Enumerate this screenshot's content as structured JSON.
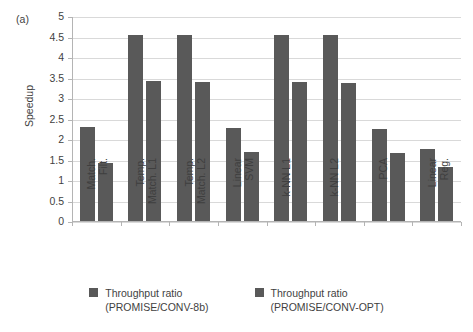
{
  "panel": {
    "label": "(a)"
  },
  "chart_data": {
    "type": "bar",
    "title": "",
    "subtitle": "",
    "xlabel": "",
    "ylabel": "Speedup",
    "ylim": [
      0,
      5
    ],
    "ytick_step": 0.5,
    "yticks": [
      "5",
      "4.5",
      "4",
      "3.5",
      "3",
      "2.5",
      "2",
      "1.5",
      "1",
      "0.5",
      "0"
    ],
    "grid": true,
    "legend_position": "bottom",
    "bar_color": "#595959",
    "categories": [
      "Match. Filt.",
      "Temp. Match. L1",
      "Temp. Match. L2",
      "Linear SVM",
      "k-NN L1",
      "k-NN L2",
      "PCA",
      "Linear Reg."
    ],
    "category_lines": [
      [
        "Match.",
        "Filt."
      ],
      [
        "Temp.",
        "Match. L1"
      ],
      [
        "Temp.",
        "Match. L2"
      ],
      [
        "Linear",
        "SVM"
      ],
      [
        "k-NN L1",
        ""
      ],
      [
        "k-NN L2",
        ""
      ],
      [
        "PCA",
        ""
      ],
      [
        "Linear",
        "Reg."
      ]
    ],
    "series": [
      {
        "name": "Throughput ratio (PROMISE/CONV-8b)",
        "name_line1": "Throughput ratio",
        "name_line2": "(PROMISE/CONV-8b)",
        "color": "#595959",
        "values": [
          2.31,
          4.57,
          4.57,
          2.3,
          4.56,
          4.55,
          2.28,
          1.79
        ]
      },
      {
        "name": "Throughput ratio (PROMISE/CONV-OPT)",
        "name_line1": "Throughput ratio",
        "name_line2": "(PROMISE/CONV-OPT)",
        "color": "#595959",
        "values": [
          1.43,
          3.43,
          3.42,
          1.7,
          3.41,
          3.4,
          1.68,
          1.33
        ]
      }
    ]
  }
}
